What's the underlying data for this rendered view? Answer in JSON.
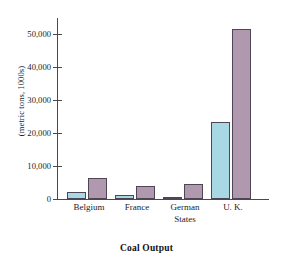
{
  "chart_data": {
    "type": "bar",
    "title": "",
    "xlabel": "Coal Output",
    "ylabel": "(metric tons, 1000s)",
    "categories": [
      "Belgium",
      "France",
      "German\nStates",
      "U. K."
    ],
    "series": [
      {
        "name": "series-1",
        "color": "#a8d8e4",
        "values": [
          2100,
          1300,
          600,
          23400
        ]
      },
      {
        "name": "series-2",
        "color": "#b098ae",
        "values": [
          6300,
          4000,
          4500,
          51800
        ]
      }
    ],
    "ylim": [
      0,
      55000
    ],
    "ytick_values": [
      0,
      10000,
      20000,
      30000,
      40000,
      50000
    ],
    "ytick_labels": [
      "0",
      "10,000",
      "20,000",
      "30,000",
      "40,000",
      "50,000"
    ],
    "grid": false,
    "legend": "none",
    "axis_color": "#4a4a4a"
  }
}
